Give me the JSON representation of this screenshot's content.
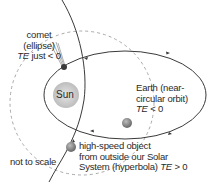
{
  "diagram": {
    "type": "orbits",
    "colors": {
      "line": "#3a3a3a",
      "dashed": "#a8a8a8",
      "sun": "#c8c8c8",
      "planet": "#8a8a8a",
      "text": "#2a2a2a"
    },
    "sun": {
      "label": "Sun"
    },
    "comet": {
      "line1": "comet",
      "line2": "(ellipse)",
      "te_symbol": "TE",
      "te_relation": " just < 0"
    },
    "earth": {
      "line1": "Earth (near-",
      "line2": "circular orbit)",
      "te_symbol": "TE",
      "te_relation": " < 0"
    },
    "hyperbola_object": {
      "line1": "high-speed object",
      "line2": "from outside our Solar",
      "line3": "System (hyperbola) ",
      "te_symbol": "TE",
      "te_relation": " > 0"
    },
    "note": "not to scale"
  }
}
